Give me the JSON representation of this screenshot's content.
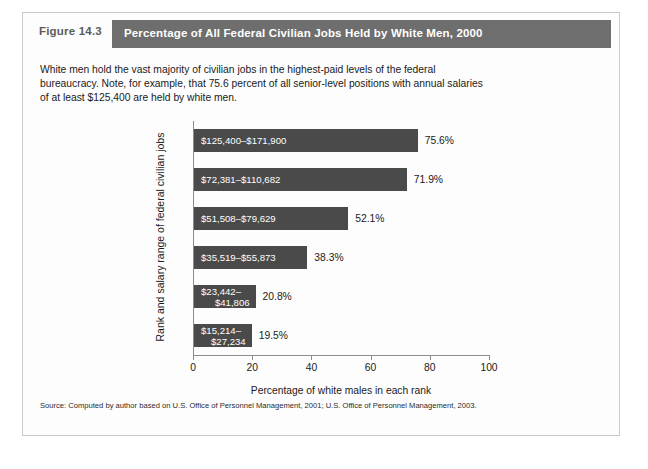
{
  "figure": {
    "number": "Figure 14.3",
    "title": "Percentage of All Federal Civilian Jobs Held by White Men, 2000",
    "blurb": "White men hold the vast majority of civilian jobs in the highest-paid levels of the federal bureaucracy. Note, for example, that 75.6 percent of all senior-level positions with annual salaries of at least $125,400 are held by white men.",
    "source": "Source: Computed by author based on U.S. Office of Personnel Management, 2001; U.S. Office of Personnel Management, 2003.",
    "header_band_color": "#6e6e6e",
    "bar_color": "#4a4a4a"
  },
  "chart_data": {
    "type": "bar",
    "orientation": "horizontal",
    "title": "Percentage of All Federal Civilian Jobs Held by White Men, 2000",
    "xlabel": "Percentage of white males in each rank",
    "ylabel": "Rank and salary range of federal civilian jobs",
    "xlim": [
      0,
      100
    ],
    "xticks": [
      0,
      20,
      40,
      60,
      80,
      100
    ],
    "xtick_labels": [
      "0",
      "20",
      "40",
      "60",
      "80",
      "100"
    ],
    "grid": false,
    "legend": false,
    "categories": [
      "$125,400–$171,900",
      "$72,381–$110,682",
      "$51,508–$79,629",
      "$35,519–$55,873",
      "$23,442–$41,806",
      "$15,214–$27,234"
    ],
    "values": [
      75.6,
      71.9,
      52.1,
      38.3,
      20.8,
      19.5
    ],
    "value_labels": [
      "75.6%",
      "71.9%",
      "52.1%",
      "38.3%",
      "20.8%",
      "19.5%"
    ],
    "bars": [
      {
        "line1": "$125,400–$171,900",
        "line2": "",
        "value": 75.6,
        "value_label": "75.6%"
      },
      {
        "line1": "$72,381–$110,682",
        "line2": "",
        "value": 71.9,
        "value_label": "71.9%"
      },
      {
        "line1": "$51,508–$79,629",
        "line2": "",
        "value": 52.1,
        "value_label": "52.1%"
      },
      {
        "line1": "$35,519–$55,873",
        "line2": "",
        "value": 38.3,
        "value_label": "38.3%"
      },
      {
        "line1": "$23,442–",
        "line2": "$41,806",
        "value": 20.8,
        "value_label": "20.8%"
      },
      {
        "line1": "$15,214–",
        "line2": "$27,234",
        "value": 19.5,
        "value_label": "19.5%"
      }
    ]
  }
}
